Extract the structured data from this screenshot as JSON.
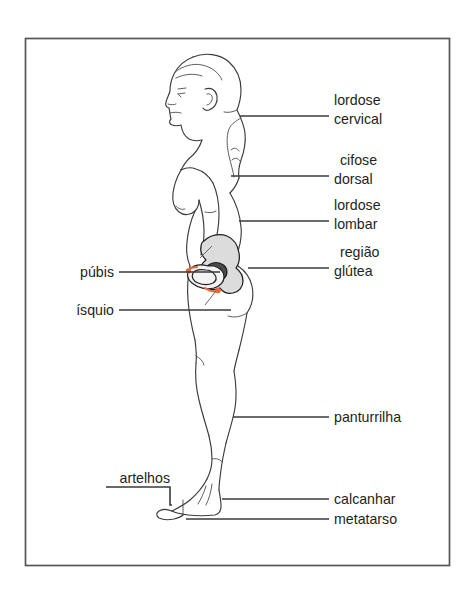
{
  "figure": {
    "language": "pt-BR",
    "frame_color": "#555558",
    "line_color": "#3c3c3c",
    "label_color": "#231f20",
    "accent_color": "#e8693c",
    "bone_fill": "#dcdcdc",
    "joint_fill": "#4b4b4b"
  },
  "labels": {
    "lordose_cervical_1": "lordose",
    "lordose_cervical_2": "cervical",
    "cifose_dorsal_1": "cifose",
    "cifose_dorsal_2": "dorsal",
    "lordose_lombar_1": "lordose",
    "lordose_lombar_2": "lombar",
    "regiao_glutea_1": "região",
    "regiao_glutea_2": "glútea",
    "pubis": "púbis",
    "isquio": "ísquio",
    "panturrilha": "panturrilha",
    "artelhos": "artelhos",
    "calcanhar": "calcanhar",
    "metatarso": "metatarso"
  },
  "annotations": [
    {
      "id": "lordose-cervical",
      "text": "lordose cervical",
      "side": "right",
      "target": "curvatura cervical da coluna"
    },
    {
      "id": "cifose-dorsal",
      "text": "cifose dorsal",
      "side": "right",
      "target": "curvatura torácica da coluna"
    },
    {
      "id": "lordose-lombar",
      "text": "lordose lombar",
      "side": "right",
      "target": "curvatura lombar da coluna"
    },
    {
      "id": "regiao-glutea",
      "text": "região glútea",
      "side": "right",
      "target": "nádega"
    },
    {
      "id": "pubis",
      "text": "púbis",
      "side": "left",
      "target": "osso púbico"
    },
    {
      "id": "isquio",
      "text": "ísquio",
      "side": "left",
      "target": "tuberosidade isquiática"
    },
    {
      "id": "panturrilha",
      "text": "panturrilha",
      "side": "right",
      "target": "musculatura posterior da perna"
    },
    {
      "id": "artelhos",
      "text": "artelhos",
      "side": "left",
      "target": "dedos do pé"
    },
    {
      "id": "calcanhar",
      "text": "calcanhar",
      "side": "right",
      "target": "calcâneo"
    },
    {
      "id": "metatarso",
      "text": "metatarso",
      "side": "right",
      "target": "ossos metatarsais"
    }
  ]
}
